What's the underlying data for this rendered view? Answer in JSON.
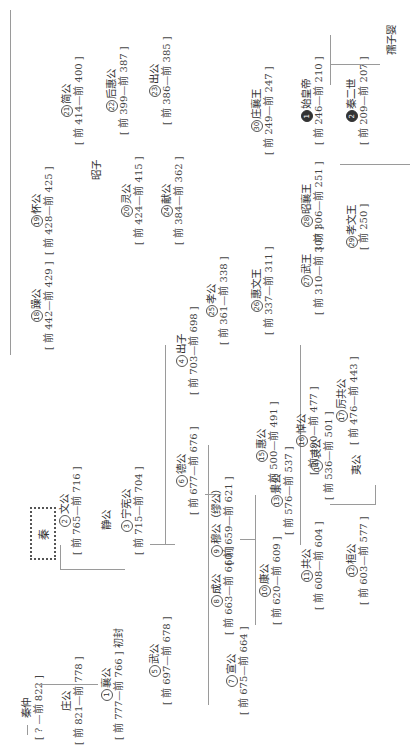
{
  "title": "秦",
  "nodes": {
    "qinzhong": {
      "name": "秦仲",
      "dates": "[ ? —前 822 ]"
    },
    "zhuanggong": {
      "name": "庄公",
      "dates": "[ 前 821—前 778 ]"
    },
    "xianggong": {
      "num": "1",
      "name": "襄公",
      "dates": "[ 前 777—前 766 ]",
      "note": "初封"
    },
    "wengong": {
      "num": "2",
      "name": "文公",
      "dates": "[ 前 765—前 716 ]"
    },
    "jinggong": {
      "name": "静公"
    },
    "ningxian": {
      "num": "3",
      "name": "宁宪公",
      "dates": "[ 前 715—前 704 ]"
    },
    "chuzi": {
      "num": "4",
      "name": "出子",
      "dates": "[ 前 703—前 698 ]"
    },
    "wugong5": {
      "num": "5",
      "name": "武公",
      "dates": "[ 前 697—前 678 ]"
    },
    "degong": {
      "num": "6",
      "name": "德公",
      "dates": "[ 前 677—前 676 ]"
    },
    "xuangong": {
      "num": "7",
      "name": "宣公",
      "dates": "[ 前 675—前 664 ]"
    },
    "chenggong": {
      "num": "8",
      "name": "成公",
      "dates": "[ 前 663—前 660 ]"
    },
    "mugong": {
      "num": "9",
      "name": "穆公（缪公）",
      "dates": "[ 前 659—前 621 ]"
    },
    "kanggong": {
      "num": "10",
      "name": "康公",
      "dates": "[ 前 620—前 609 ]"
    },
    "gonggong": {
      "num": "11",
      "name": "共公",
      "dates": "[ 前 608—前 604 ]"
    },
    "huangong": {
      "num": "12",
      "name": "桓公",
      "dates": "[ 前 603—前 577 ]"
    },
    "jinggong13": {
      "num": "13",
      "name": "景公",
      "dates": "[ 前 576—前 537 ]"
    },
    "aigong": {
      "num": "14",
      "name": "哀公",
      "dates": "[ 前 536—前 501 ]"
    },
    "yigong": {
      "name": "夷公"
    },
    "huigong15": {
      "num": "15",
      "name": "惠公",
      "dates": "[ 前 500—前 491 ]"
    },
    "daogong": {
      "num": "16",
      "name": "悼公",
      "dates": "[ 前 490—前 477 ]"
    },
    "ligong": {
      "num": "17",
      "name": "厉共公",
      "dates": "[ 前 476—前 443 ]"
    },
    "zaogong": {
      "num": "18",
      "name": "躁公",
      "dates": "[ 前 442—前 429 ]"
    },
    "huaigong": {
      "num": "19",
      "name": "怀公",
      "dates": "[ 前 428—前 425 ]"
    },
    "zhaozi": {
      "name": "昭子"
    },
    "linggong": {
      "num": "20",
      "name": "灵公",
      "dates": "[ 前 424—前 415 ]"
    },
    "jiangong": {
      "num": "21",
      "name": "简公",
      "dates": "[ 前 414—前 400 ]"
    },
    "houhui": {
      "num": "22",
      "name": "后惠公",
      "dates": "[ 前 399—前 387 ]"
    },
    "chuzi23": {
      "num": "23",
      "name": "出公",
      "dates": "[ 前 386—前 385 ]"
    },
    "xiangong": {
      "num": "24",
      "name": "献公",
      "dates": "[ 前 384—前 362 ]"
    },
    "xiaogong": {
      "num": "25",
      "name": "孝公",
      "dates": "[ 前 361—前 338 ]"
    },
    "huiwen": {
      "num": "26",
      "name": "惠文王",
      "dates": "[ 前 337—前 311 ]"
    },
    "wuwang": {
      "num": "27",
      "name": "武王",
      "dates": "[ 前 310—前 307 ]"
    },
    "zhaoxiang": {
      "num": "28",
      "name": "昭襄王",
      "dates": "[ 前 306—前 251 ]"
    },
    "xiaowen": {
      "num": "29",
      "name": "孝文王",
      "dates": "[ 前 250 ]"
    },
    "zhuangxiang": {
      "num": "30",
      "name": "庄襄王",
      "dates": "[ 前 249—前 247 ]"
    },
    "shihuang": {
      "num": "1",
      "name": "始皇帝",
      "dates": "[ 前 246—前 210 ]"
    },
    "ershi": {
      "num": "2",
      "name": "秦二世",
      "dates": "[ 前 209—前 207 ]"
    },
    "ziying": {
      "name": "孺子婴"
    }
  }
}
